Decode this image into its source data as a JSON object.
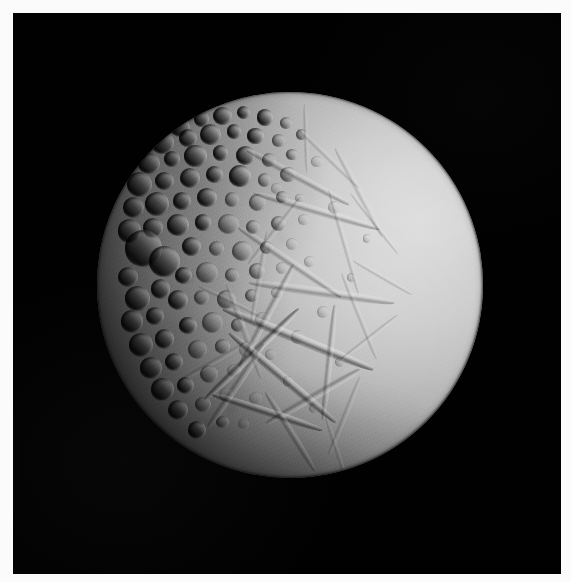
{
  "image": {
    "subject": "Enceladus",
    "subject_kind": "icy moon",
    "description": "Grayscale spacecraft photograph of a cratered icy moon lit from the right, filling most of a black field of space, surrounded by a thin white print border.",
    "orientation": "portrait",
    "width": 571,
    "height": 582,
    "color_mode": "grayscale"
  },
  "frame": {
    "border_color": "#fbfbfb",
    "border_top": 13,
    "border_left": 13,
    "border_right": 10,
    "border_bottom": 8
  },
  "background": {
    "name": "space",
    "color": "#010101"
  },
  "moon": {
    "center_x": 290,
    "center_y": 285,
    "radius": 193,
    "illumination_direction": "upper-right",
    "terminator_side": "left",
    "bright_tone": "#d6d6d6",
    "mid_tone": "#9a9a9a",
    "dark_tone": "#2a2a2a",
    "shadow_tone": "#060606"
  },
  "terrain": {
    "regions": [
      {
        "name": "cratered-terrain",
        "label": "Densely cratered ancient terrain",
        "location": "upper-left and left limb",
        "tone": "#8a8a8a"
      },
      {
        "name": "smooth-plains",
        "label": "Smooth bright resurfaced plains",
        "location": "right and lower-right",
        "tone": "#cfcfcf"
      },
      {
        "name": "grooved-terrain",
        "label": "Crosshatched grooves and fractures",
        "location": "lower-center and lower-right",
        "tone": "#bdbdbd"
      }
    ],
    "craters": [
      {
        "x": 21.5,
        "y": 9.0,
        "d": 5.2,
        "type": "deep"
      },
      {
        "x": 27.0,
        "y": 7.0,
        "d": 4.0,
        "type": "deep"
      },
      {
        "x": 32.5,
        "y": 6.2,
        "d": 4.8,
        "type": "deep"
      },
      {
        "x": 38.0,
        "y": 5.4,
        "d": 3.4,
        "type": "deep"
      },
      {
        "x": 43.5,
        "y": 6.6,
        "d": 4.2,
        "type": "deep"
      },
      {
        "x": 49.0,
        "y": 8.0,
        "d": 3.0,
        "type": "normal"
      },
      {
        "x": 17.0,
        "y": 13.0,
        "d": 6.0,
        "type": "deep"
      },
      {
        "x": 23.5,
        "y": 12.0,
        "d": 4.6,
        "type": "deep"
      },
      {
        "x": 29.5,
        "y": 11.0,
        "d": 5.4,
        "type": "deep"
      },
      {
        "x": 35.5,
        "y": 10.2,
        "d": 3.8,
        "type": "deep"
      },
      {
        "x": 41.0,
        "y": 11.4,
        "d": 4.4,
        "type": "deep"
      },
      {
        "x": 47.0,
        "y": 12.6,
        "d": 3.2,
        "type": "normal"
      },
      {
        "x": 53.0,
        "y": 11.0,
        "d": 2.8,
        "type": "normal"
      },
      {
        "x": 13.5,
        "y": 18.5,
        "d": 5.6,
        "type": "deep"
      },
      {
        "x": 19.5,
        "y": 17.4,
        "d": 4.2,
        "type": "deep"
      },
      {
        "x": 25.5,
        "y": 16.6,
        "d": 5.8,
        "type": "deep"
      },
      {
        "x": 32.0,
        "y": 15.8,
        "d": 4.0,
        "type": "deep"
      },
      {
        "x": 38.5,
        "y": 16.4,
        "d": 5.0,
        "type": "deep"
      },
      {
        "x": 44.5,
        "y": 17.6,
        "d": 3.6,
        "type": "normal"
      },
      {
        "x": 50.5,
        "y": 16.2,
        "d": 3.0,
        "type": "normal"
      },
      {
        "x": 11.0,
        "y": 24.0,
        "d": 6.6,
        "type": "deep"
      },
      {
        "x": 17.5,
        "y": 23.0,
        "d": 4.8,
        "type": "deep"
      },
      {
        "x": 24.0,
        "y": 22.2,
        "d": 5.2,
        "type": "deep"
      },
      {
        "x": 30.5,
        "y": 21.4,
        "d": 4.4,
        "type": "deep"
      },
      {
        "x": 37.0,
        "y": 21.8,
        "d": 5.6,
        "type": "deep"
      },
      {
        "x": 43.5,
        "y": 22.8,
        "d": 3.4,
        "type": "normal"
      },
      {
        "x": 49.5,
        "y": 21.4,
        "d": 4.0,
        "type": "normal"
      },
      {
        "x": 9.5,
        "y": 30.0,
        "d": 5.4,
        "type": "deep"
      },
      {
        "x": 15.5,
        "y": 29.0,
        "d": 6.2,
        "type": "deep"
      },
      {
        "x": 22.0,
        "y": 28.2,
        "d": 4.6,
        "type": "deep"
      },
      {
        "x": 28.5,
        "y": 27.4,
        "d": 5.0,
        "type": "deep"
      },
      {
        "x": 35.0,
        "y": 27.8,
        "d": 3.8,
        "type": "normal"
      },
      {
        "x": 41.5,
        "y": 28.6,
        "d": 4.4,
        "type": "normal"
      },
      {
        "x": 48.0,
        "y": 27.2,
        "d": 3.2,
        "type": "normal"
      },
      {
        "x": 8.5,
        "y": 36.0,
        "d": 6.0,
        "type": "deep"
      },
      {
        "x": 14.5,
        "y": 35.2,
        "d": 5.0,
        "type": "deep"
      },
      {
        "x": 12.0,
        "y": 40.5,
        "d": 9.5,
        "type": "deep"
      },
      {
        "x": 17.5,
        "y": 44.0,
        "d": 8.0,
        "type": "deep"
      },
      {
        "x": 21.0,
        "y": 34.5,
        "d": 5.6,
        "type": "deep"
      },
      {
        "x": 27.5,
        "y": 33.8,
        "d": 4.2,
        "type": "deep"
      },
      {
        "x": 34.0,
        "y": 34.2,
        "d": 5.4,
        "type": "normal"
      },
      {
        "x": 40.5,
        "y": 35.0,
        "d": 3.6,
        "type": "normal"
      },
      {
        "x": 47.0,
        "y": 34.0,
        "d": 4.0,
        "type": "normal"
      },
      {
        "x": 53.5,
        "y": 33.0,
        "d": 2.8,
        "type": "soft"
      },
      {
        "x": 8.0,
        "y": 48.0,
        "d": 5.2,
        "type": "deep"
      },
      {
        "x": 24.5,
        "y": 40.0,
        "d": 4.8,
        "type": "deep"
      },
      {
        "x": 31.0,
        "y": 40.6,
        "d": 4.0,
        "type": "normal"
      },
      {
        "x": 37.5,
        "y": 41.2,
        "d": 5.2,
        "type": "normal"
      },
      {
        "x": 44.0,
        "y": 40.2,
        "d": 3.4,
        "type": "normal"
      },
      {
        "x": 50.5,
        "y": 39.4,
        "d": 3.0,
        "type": "soft"
      },
      {
        "x": 10.5,
        "y": 53.5,
        "d": 6.4,
        "type": "deep"
      },
      {
        "x": 16.5,
        "y": 51.0,
        "d": 5.0,
        "type": "deep"
      },
      {
        "x": 22.5,
        "y": 47.5,
        "d": 4.4,
        "type": "deep"
      },
      {
        "x": 28.5,
        "y": 46.8,
        "d": 5.6,
        "type": "normal"
      },
      {
        "x": 35.0,
        "y": 47.4,
        "d": 3.8,
        "type": "normal"
      },
      {
        "x": 41.5,
        "y": 46.4,
        "d": 4.2,
        "type": "normal"
      },
      {
        "x": 48.0,
        "y": 45.6,
        "d": 3.0,
        "type": "soft"
      },
      {
        "x": 9.0,
        "y": 59.5,
        "d": 5.8,
        "type": "deep"
      },
      {
        "x": 15.0,
        "y": 58.0,
        "d": 4.6,
        "type": "deep"
      },
      {
        "x": 21.0,
        "y": 54.0,
        "d": 5.2,
        "type": "deep"
      },
      {
        "x": 27.0,
        "y": 53.2,
        "d": 4.0,
        "type": "normal"
      },
      {
        "x": 33.5,
        "y": 53.8,
        "d": 5.0,
        "type": "normal"
      },
      {
        "x": 40.0,
        "y": 52.8,
        "d": 3.4,
        "type": "normal"
      },
      {
        "x": 46.5,
        "y": 52.0,
        "d": 2.8,
        "type": "soft"
      },
      {
        "x": 11.5,
        "y": 65.5,
        "d": 6.2,
        "type": "deep"
      },
      {
        "x": 17.5,
        "y": 64.0,
        "d": 5.0,
        "type": "deep"
      },
      {
        "x": 23.5,
        "y": 60.5,
        "d": 4.6,
        "type": "deep"
      },
      {
        "x": 30.0,
        "y": 59.8,
        "d": 5.4,
        "type": "normal"
      },
      {
        "x": 36.5,
        "y": 60.4,
        "d": 3.6,
        "type": "normal"
      },
      {
        "x": 43.0,
        "y": 59.0,
        "d": 4.0,
        "type": "soft"
      },
      {
        "x": 14.0,
        "y": 71.5,
        "d": 5.6,
        "type": "deep"
      },
      {
        "x": 20.0,
        "y": 70.0,
        "d": 4.8,
        "type": "deep"
      },
      {
        "x": 26.0,
        "y": 66.8,
        "d": 5.0,
        "type": "normal"
      },
      {
        "x": 32.5,
        "y": 66.0,
        "d": 3.8,
        "type": "normal"
      },
      {
        "x": 39.0,
        "y": 66.6,
        "d": 4.4,
        "type": "soft"
      },
      {
        "x": 17.0,
        "y": 77.0,
        "d": 6.0,
        "type": "deep"
      },
      {
        "x": 23.0,
        "y": 76.0,
        "d": 4.4,
        "type": "deep"
      },
      {
        "x": 29.0,
        "y": 73.0,
        "d": 4.8,
        "type": "normal"
      },
      {
        "x": 35.5,
        "y": 72.2,
        "d": 3.4,
        "type": "soft"
      },
      {
        "x": 21.0,
        "y": 82.5,
        "d": 5.2,
        "type": "deep"
      },
      {
        "x": 27.5,
        "y": 81.0,
        "d": 4.0,
        "type": "normal"
      },
      {
        "x": 33.5,
        "y": 78.5,
        "d": 3.6,
        "type": "soft"
      },
      {
        "x": 26.0,
        "y": 87.5,
        "d": 4.6,
        "type": "deep"
      },
      {
        "x": 32.5,
        "y": 85.5,
        "d": 3.2,
        "type": "normal"
      },
      {
        "x": 57.0,
        "y": 18.0,
        "d": 3.0,
        "type": "soft"
      },
      {
        "x": 61.5,
        "y": 30.0,
        "d": 3.4,
        "type": "soft"
      },
      {
        "x": 55.0,
        "y": 44.0,
        "d": 2.8,
        "type": "soft"
      },
      {
        "x": 58.5,
        "y": 57.0,
        "d": 3.2,
        "type": "soft"
      },
      {
        "x": 52.0,
        "y": 63.5,
        "d": 3.6,
        "type": "soft"
      },
      {
        "x": 45.0,
        "y": 68.0,
        "d": 3.0,
        "type": "soft"
      },
      {
        "x": 49.5,
        "y": 75.0,
        "d": 2.6,
        "type": "soft"
      },
      {
        "x": 41.0,
        "y": 79.5,
        "d": 3.4,
        "type": "soft"
      },
      {
        "x": 38.0,
        "y": 86.0,
        "d": 2.8,
        "type": "soft"
      },
      {
        "x": 66.0,
        "y": 48.0,
        "d": 2.4,
        "type": "soft"
      },
      {
        "x": 70.0,
        "y": 38.0,
        "d": 2.2,
        "type": "soft"
      },
      {
        "x": 63.0,
        "y": 70.0,
        "d": 2.6,
        "type": "soft"
      },
      {
        "x": 56.0,
        "y": 82.0,
        "d": 2.4,
        "type": "soft"
      },
      {
        "x": 46.5,
        "y": 25.0,
        "d": 2.6,
        "type": "soft"
      },
      {
        "x": 52.5,
        "y": 27.5,
        "d": 2.2,
        "type": "soft"
      }
    ],
    "grooves": [
      {
        "x": 52,
        "y": 22,
        "len": 30,
        "w": 2.0,
        "rot": 28,
        "type": "normal"
      },
      {
        "x": 60,
        "y": 17,
        "len": 22,
        "w": 1.6,
        "rot": 44,
        "type": "faint"
      },
      {
        "x": 68,
        "y": 26,
        "len": 26,
        "w": 1.8,
        "rot": 62,
        "type": "faint"
      },
      {
        "x": 57,
        "y": 31,
        "len": 34,
        "w": 2.2,
        "rot": 16,
        "type": "normal"
      },
      {
        "x": 64,
        "y": 39,
        "len": 28,
        "w": 1.6,
        "rot": 74,
        "type": "faint"
      },
      {
        "x": 72,
        "y": 34,
        "len": 20,
        "w": 1.4,
        "rot": 52,
        "type": "faint"
      },
      {
        "x": 50,
        "y": 44,
        "len": 32,
        "w": 2.0,
        "rot": 34,
        "type": "normal"
      },
      {
        "x": 58,
        "y": 52,
        "len": 38,
        "w": 2.4,
        "rot": 8,
        "type": "normal"
      },
      {
        "x": 68,
        "y": 58,
        "len": 24,
        "w": 1.6,
        "rot": 68,
        "type": "faint"
      },
      {
        "x": 44,
        "y": 58,
        "len": 30,
        "w": 2.0,
        "rot": 118,
        "type": "normal"
      },
      {
        "x": 52,
        "y": 64,
        "len": 42,
        "w": 2.6,
        "rot": 22,
        "type": "strong"
      },
      {
        "x": 40,
        "y": 68,
        "len": 34,
        "w": 2.2,
        "rot": 136,
        "type": "strong"
      },
      {
        "x": 60,
        "y": 70,
        "len": 30,
        "w": 1.8,
        "rot": 96,
        "type": "normal"
      },
      {
        "x": 48,
        "y": 74,
        "len": 36,
        "w": 2.4,
        "rot": 40,
        "type": "strong"
      },
      {
        "x": 36,
        "y": 76,
        "len": 26,
        "w": 2.0,
        "rot": 124,
        "type": "normal"
      },
      {
        "x": 56,
        "y": 79,
        "len": 28,
        "w": 2.0,
        "rot": 150,
        "type": "normal"
      },
      {
        "x": 44,
        "y": 83,
        "len": 30,
        "w": 2.2,
        "rot": 18,
        "type": "strong"
      },
      {
        "x": 64,
        "y": 84,
        "len": 22,
        "w": 1.6,
        "rot": 112,
        "type": "faint"
      },
      {
        "x": 50,
        "y": 88,
        "len": 24,
        "w": 1.8,
        "rot": 58,
        "type": "normal"
      },
      {
        "x": 38,
        "y": 62,
        "len": 26,
        "w": 1.8,
        "rot": 70,
        "type": "faint"
      },
      {
        "x": 30,
        "y": 70,
        "len": 20,
        "w": 1.6,
        "rot": 150,
        "type": "faint"
      },
      {
        "x": 74,
        "y": 48,
        "len": 18,
        "w": 1.4,
        "rot": 30,
        "type": "faint"
      },
      {
        "x": 70,
        "y": 64,
        "len": 20,
        "w": 1.4,
        "rot": 142,
        "type": "faint"
      },
      {
        "x": 42,
        "y": 48,
        "len": 24,
        "w": 1.6,
        "rot": 100,
        "type": "faint"
      },
      {
        "x": 46,
        "y": 36,
        "len": 22,
        "w": 1.6,
        "rot": 128,
        "type": "faint"
      },
      {
        "x": 34,
        "y": 54,
        "len": 18,
        "w": 1.4,
        "rot": 26,
        "type": "faint"
      },
      {
        "x": 62,
        "y": 92,
        "len": 16,
        "w": 1.2,
        "rot": 72,
        "type": "faint"
      },
      {
        "x": 54,
        "y": 12,
        "len": 18,
        "w": 1.4,
        "rot": 88,
        "type": "faint"
      }
    ]
  }
}
